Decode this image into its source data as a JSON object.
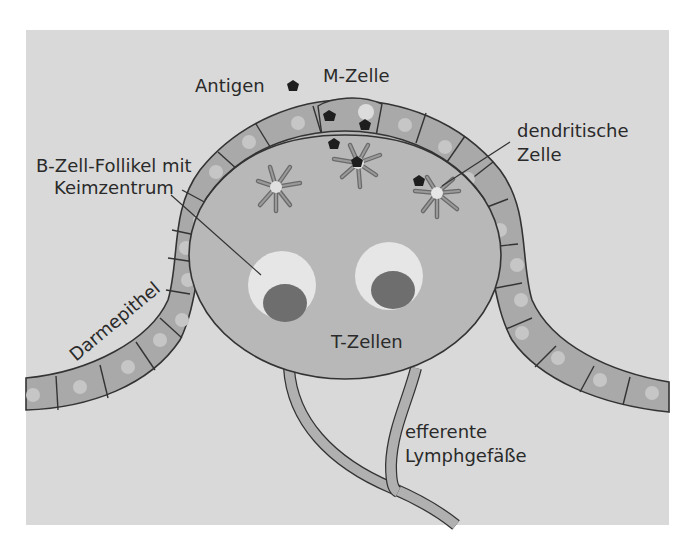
{
  "figure": {
    "labels": {
      "antigen": "Antigen",
      "m_cell": "M-Zelle",
      "b_follicle_line1": "B-Zell-Follikel mit",
      "b_follicle_line2": "Keimzentrum",
      "dendritic_line1": "dendritische",
      "dendritic_line2": "Zelle",
      "epithelium": "Darmepithel",
      "t_cells": "T-Zellen",
      "lymph_line1": "efferente",
      "lymph_line2": "Lymphgefäße"
    },
    "colors": {
      "panel": "#d9d9d9",
      "epithelium_cell": "#a9a9a9",
      "nucleus": "#c6c6c6",
      "dome": "#b8b8b8",
      "follicle_halo": "#e6e6e6",
      "germinal_center": "#6e6e6e",
      "antigen": "#1e1e1e",
      "outline": "#333333",
      "lymph_vessel": "#b0b0b0",
      "white_background": "#ffffff"
    }
  }
}
